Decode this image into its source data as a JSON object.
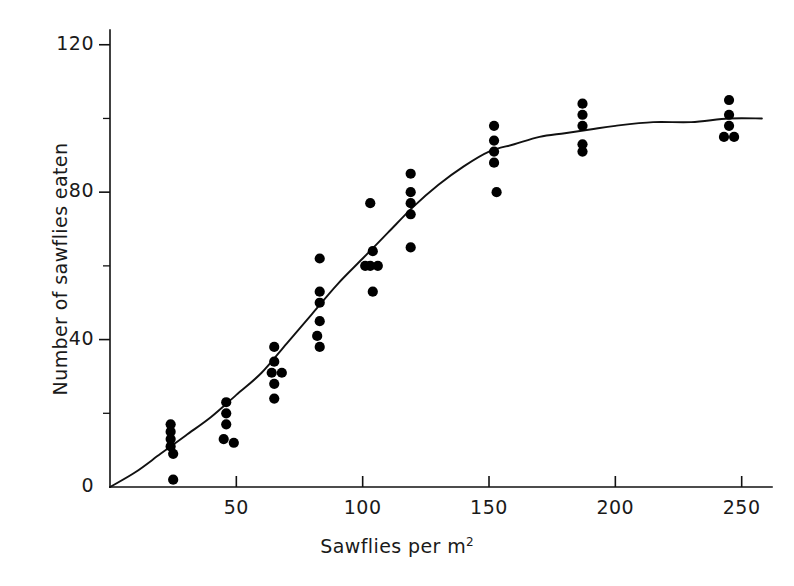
{
  "figure": {
    "background_color": "#ffffff",
    "ink_color": "#111111",
    "point_color": "#000000"
  },
  "chart_data": {
    "type": "scatter",
    "title": "",
    "xlabel": "Sawflies per m",
    "xlabel_superscript": "2",
    "ylabel": "Number of sawflies eaten",
    "xlim": [
      0,
      262
    ],
    "ylim": [
      0,
      124
    ],
    "grid": false,
    "legend": null,
    "x_ticks": [
      50,
      100,
      150,
      200,
      250
    ],
    "x_tick_labels": [
      "50",
      "100",
      "150",
      "200",
      "250"
    ],
    "x_minor_ticks": [],
    "y_ticks": [
      0,
      40,
      80,
      120
    ],
    "y_tick_labels": [
      "0",
      "40",
      "80",
      "120"
    ],
    "y_minor_ticks": [
      20,
      60,
      100
    ],
    "tick_direction_y": "out-left",
    "tick_direction_x": "out-up",
    "points": [
      {
        "x": 24,
        "y": 17
      },
      {
        "x": 24,
        "y": 15
      },
      {
        "x": 24,
        "y": 13
      },
      {
        "x": 24,
        "y": 11
      },
      {
        "x": 25,
        "y": 9
      },
      {
        "x": 25,
        "y": 2
      },
      {
        "x": 46,
        "y": 23
      },
      {
        "x": 46,
        "y": 20
      },
      {
        "x": 46,
        "y": 17
      },
      {
        "x": 45,
        "y": 13
      },
      {
        "x": 49,
        "y": 12
      },
      {
        "x": 65,
        "y": 38
      },
      {
        "x": 65,
        "y": 34
      },
      {
        "x": 64,
        "y": 31
      },
      {
        "x": 68,
        "y": 31
      },
      {
        "x": 65,
        "y": 28
      },
      {
        "x": 65,
        "y": 24
      },
      {
        "x": 83,
        "y": 62
      },
      {
        "x": 83,
        "y": 53
      },
      {
        "x": 83,
        "y": 50
      },
      {
        "x": 83,
        "y": 45
      },
      {
        "x": 82,
        "y": 41
      },
      {
        "x": 83,
        "y": 38
      },
      {
        "x": 103,
        "y": 77
      },
      {
        "x": 104,
        "y": 64
      },
      {
        "x": 106,
        "y": 60
      },
      {
        "x": 103,
        "y": 60
      },
      {
        "x": 101,
        "y": 60
      },
      {
        "x": 104,
        "y": 53
      },
      {
        "x": 119,
        "y": 85
      },
      {
        "x": 119,
        "y": 80
      },
      {
        "x": 119,
        "y": 77
      },
      {
        "x": 119,
        "y": 74
      },
      {
        "x": 119,
        "y": 65
      },
      {
        "x": 152,
        "y": 98
      },
      {
        "x": 152,
        "y": 94
      },
      {
        "x": 152,
        "y": 91
      },
      {
        "x": 152,
        "y": 88
      },
      {
        "x": 153,
        "y": 80
      },
      {
        "x": 187,
        "y": 104
      },
      {
        "x": 187,
        "y": 101
      },
      {
        "x": 187,
        "y": 98
      },
      {
        "x": 187,
        "y": 93
      },
      {
        "x": 187,
        "y": 91
      },
      {
        "x": 245,
        "y": 105
      },
      {
        "x": 245,
        "y": 101
      },
      {
        "x": 245,
        "y": 98
      },
      {
        "x": 243,
        "y": 95
      },
      {
        "x": 247,
        "y": 95
      }
    ],
    "fit_curve": {
      "description": "sigmoid functional response curve",
      "asymptote": 100,
      "x_range": [
        0,
        258
      ],
      "points": [
        {
          "x": 0,
          "y": 0
        },
        {
          "x": 10,
          "y": 4
        },
        {
          "x": 20,
          "y": 9
        },
        {
          "x": 30,
          "y": 14
        },
        {
          "x": 40,
          "y": 19
        },
        {
          "x": 50,
          "y": 25
        },
        {
          "x": 60,
          "y": 31
        },
        {
          "x": 70,
          "y": 39
        },
        {
          "x": 80,
          "y": 47
        },
        {
          "x": 90,
          "y": 55
        },
        {
          "x": 100,
          "y": 62
        },
        {
          "x": 110,
          "y": 69
        },
        {
          "x": 120,
          "y": 76
        },
        {
          "x": 130,
          "y": 82
        },
        {
          "x": 140,
          "y": 87
        },
        {
          "x": 150,
          "y": 91
        },
        {
          "x": 160,
          "y": 93
        },
        {
          "x": 170,
          "y": 95
        },
        {
          "x": 180,
          "y": 96
        },
        {
          "x": 190,
          "y": 97
        },
        {
          "x": 200,
          "y": 98
        },
        {
          "x": 215,
          "y": 99
        },
        {
          "x": 230,
          "y": 99
        },
        {
          "x": 245,
          "y": 100
        },
        {
          "x": 258,
          "y": 100
        }
      ]
    }
  }
}
